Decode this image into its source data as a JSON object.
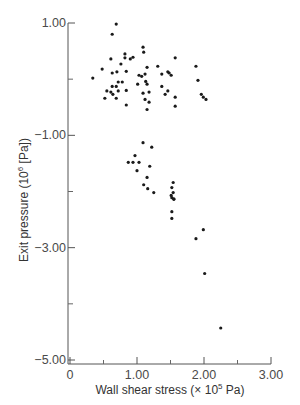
{
  "chart_data": {
    "type": "scatter",
    "title": "",
    "xlabel": "Wall shear stress (× 10",
    "xlabel_sup": "5",
    "xlabel_tail": " Pa)",
    "ylabel": "Exit pressure (10",
    "ylabel_sup": "6",
    "ylabel_tail": " [Pa])",
    "xlim": [
      0,
      3.0
    ],
    "ylim": [
      -5.0,
      1.0
    ],
    "x_ticks": [
      0,
      1.0,
      2.0,
      3.0
    ],
    "x_tick_labels": [
      "0",
      "1.00",
      "2.00",
      "3.00"
    ],
    "x_minor_ticks": [
      0.5,
      1.5,
      2.5
    ],
    "y_ticks": [
      1.0,
      -1.0,
      -3.0,
      -5.0
    ],
    "y_tick_labels": [
      "1.00",
      "−1.00",
      "−3.00",
      "−5.00"
    ],
    "y_minor_ticks": [
      0.0,
      -2.0,
      -4.0
    ],
    "grid": false,
    "marker_color": "#1a1a1a",
    "points": [
      [
        0.69,
        0.98
      ],
      [
        0.63,
        0.8
      ],
      [
        1.09,
        0.57
      ],
      [
        1.1,
        0.48
      ],
      [
        0.61,
        0.36
      ],
      [
        0.82,
        0.45
      ],
      [
        0.82,
        0.38
      ],
      [
        0.9,
        0.36
      ],
      [
        0.94,
        0.39
      ],
      [
        1.57,
        0.38
      ],
      [
        0.76,
        0.27
      ],
      [
        0.48,
        0.18
      ],
      [
        1.31,
        0.23
      ],
      [
        1.88,
        0.23
      ],
      [
        1.15,
        0.21
      ],
      [
        0.63,
        0.11
      ],
      [
        0.7,
        0.13
      ],
      [
        0.84,
        0.14
      ],
      [
        1.46,
        0.13
      ],
      [
        1.48,
        0.11
      ],
      [
        1.51,
        0.07
      ],
      [
        0.34,
        0.02
      ],
      [
        1.03,
        0.07
      ],
      [
        1.07,
        0.05
      ],
      [
        1.12,
        0.09
      ],
      [
        1.37,
        0.09
      ],
      [
        1.91,
        -0.02
      ],
      [
        0.72,
        -0.05
      ],
      [
        0.78,
        -0.05
      ],
      [
        1.13,
        -0.04
      ],
      [
        1.01,
        -0.09
      ],
      [
        1.15,
        -0.09
      ],
      [
        0.63,
        -0.13
      ],
      [
        0.69,
        -0.13
      ],
      [
        1.37,
        -0.13
      ],
      [
        0.72,
        -0.21
      ],
      [
        0.84,
        -0.2
      ],
      [
        0.55,
        -0.21
      ],
      [
        0.61,
        -0.23
      ],
      [
        0.64,
        -0.27
      ],
      [
        1.09,
        -0.25
      ],
      [
        1.18,
        -0.23
      ],
      [
        1.42,
        -0.27
      ],
      [
        1.46,
        -0.21
      ],
      [
        0.52,
        -0.34
      ],
      [
        0.69,
        -0.34
      ],
      [
        1.12,
        -0.36
      ],
      [
        1.96,
        -0.27
      ],
      [
        1.99,
        -0.32
      ],
      [
        2.03,
        -0.36
      ],
      [
        1.57,
        -0.32
      ],
      [
        1.18,
        -0.41
      ],
      [
        0.84,
        -0.46
      ],
      [
        1.57,
        -0.48
      ],
      [
        1.15,
        -0.54
      ],
      [
        1.09,
        -1.13
      ],
      [
        1.22,
        -1.21
      ],
      [
        0.97,
        -1.36
      ],
      [
        0.87,
        -1.48
      ],
      [
        0.94,
        -1.48
      ],
      [
        1.03,
        -1.48
      ],
      [
        1.19,
        -1.55
      ],
      [
        1.0,
        -1.63
      ],
      [
        1.15,
        -1.75
      ],
      [
        1.1,
        -1.88
      ],
      [
        1.16,
        -1.95
      ],
      [
        1.25,
        -2.02
      ],
      [
        1.54,
        -1.84
      ],
      [
        1.52,
        -1.93
      ],
      [
        1.54,
        -2.02
      ],
      [
        1.51,
        -2.07
      ],
      [
        1.52,
        -2.11
      ],
      [
        1.55,
        -2.13
      ],
      [
        1.55,
        -2.14
      ],
      [
        1.52,
        -2.36
      ],
      [
        1.52,
        -2.48
      ],
      [
        1.99,
        -2.68
      ],
      [
        1.88,
        -2.84
      ],
      [
        2.01,
        -3.46
      ],
      [
        2.25,
        -4.43
      ]
    ]
  }
}
